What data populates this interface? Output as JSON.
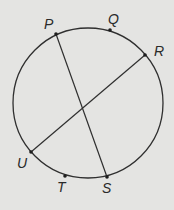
{
  "diagram": {
    "background": "#e4e4e2",
    "stroke_color": "#2f2f2f",
    "circle": {
      "cx": 88,
      "cy": 103,
      "r": 75
    },
    "points": [
      {
        "name": "P",
        "x": 56,
        "y": 34,
        "label_x": 44,
        "label_y": 29
      },
      {
        "name": "Q",
        "x": 110,
        "y": 30,
        "label_x": 108,
        "label_y": 24
      },
      {
        "name": "R",
        "x": 145,
        "y": 55,
        "label_x": 154,
        "label_y": 56
      },
      {
        "name": "U",
        "x": 31,
        "y": 152,
        "label_x": 17,
        "label_y": 168
      },
      {
        "name": "T",
        "x": 65,
        "y": 176,
        "label_x": 57,
        "label_y": 192
      },
      {
        "name": "S",
        "x": 107,
        "y": 177,
        "label_x": 102,
        "label_y": 193
      }
    ],
    "chords": [
      {
        "name": "PS",
        "from": "P",
        "to": "S"
      },
      {
        "name": "RU",
        "from": "R",
        "to": "U"
      }
    ],
    "labels": {
      "P": "P",
      "Q": "Q",
      "R": "R",
      "S": "S",
      "T": "T",
      "U": "U"
    }
  }
}
